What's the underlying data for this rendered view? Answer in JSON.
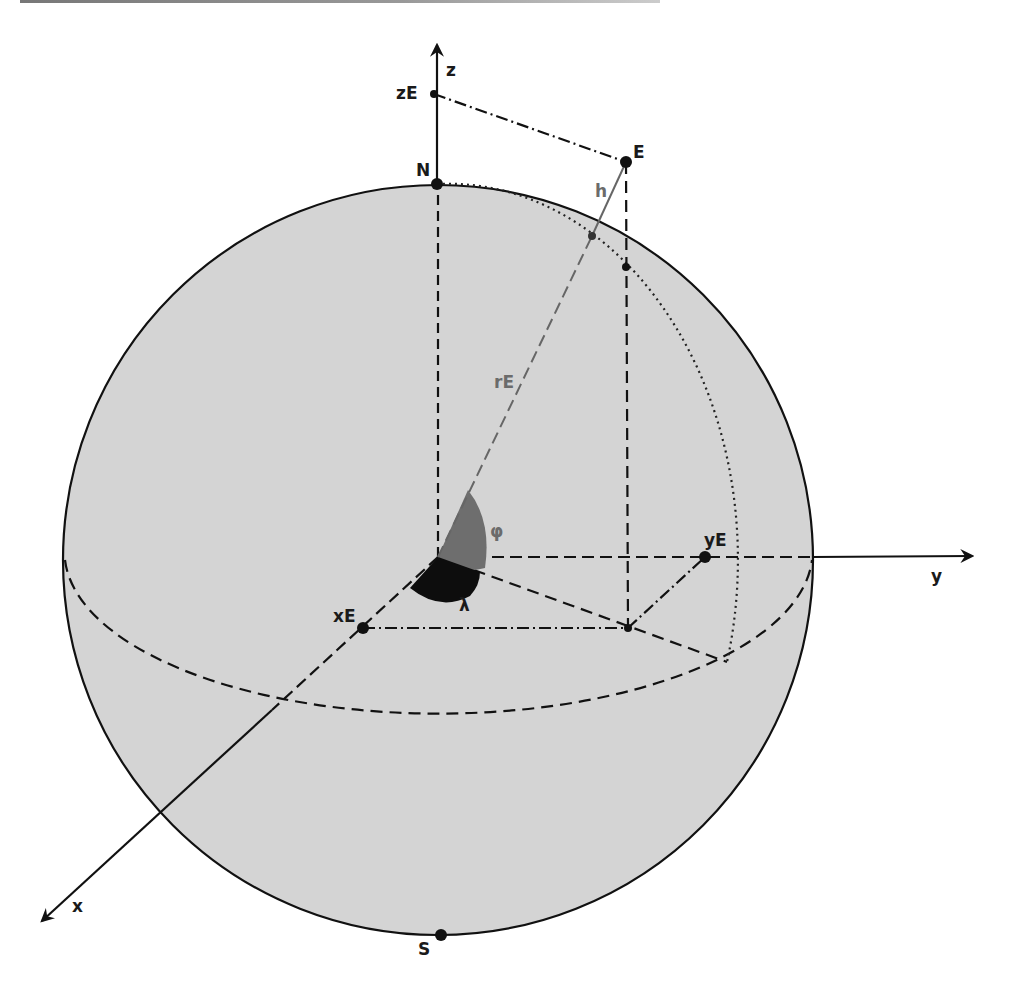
{
  "diagram": {
    "colors": {
      "sphere_fill": "#d4d4d4",
      "line": "#111111",
      "phi_wedge": "#6e6e6e",
      "lambda_wedge": "#0d0d0d",
      "secondary_label": "#6b6b6b"
    },
    "axes": {
      "x": {
        "label": "x"
      },
      "y": {
        "label": "y"
      },
      "z": {
        "label": "z"
      }
    },
    "points": {
      "north_pole": {
        "label": "N"
      },
      "south_pole": {
        "label": "S"
      },
      "point_e": {
        "label": "E"
      },
      "x_projection": {
        "label": "xE"
      },
      "y_projection": {
        "label": "yE"
      },
      "z_projection": {
        "label": "zE"
      }
    },
    "segments": {
      "radius": {
        "label": "rE"
      },
      "height": {
        "label": "h"
      }
    },
    "angles": {
      "latitude": {
        "label": "φ"
      },
      "longitude": {
        "label": "λ"
      }
    }
  }
}
